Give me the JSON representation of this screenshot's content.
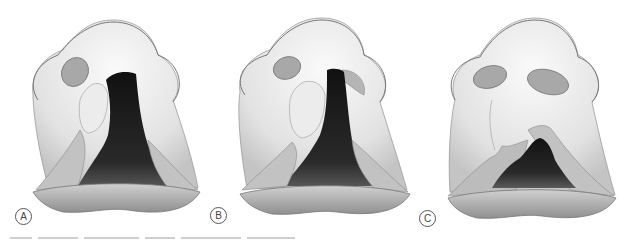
{
  "figure": {
    "panels": [
      {
        "id": "A",
        "label": "A",
        "description": "Wide unilateral cleft lip with open cleft extending into nostril"
      },
      {
        "id": "B",
        "label": "B",
        "description": "Unilateral cleft lip with narrower cleft extending into nostril"
      },
      {
        "id": "C",
        "label": "C",
        "description": "Incomplete cleft lip with intact nostril sill"
      }
    ],
    "colors": {
      "skin_light": "#f1f1f1",
      "skin_shade": "#bdbdbd",
      "outline": "#7a7a7a",
      "cleft_dark": "#1b1b1b",
      "lip": "#a9a9a9"
    },
    "caption_visible": false
  }
}
